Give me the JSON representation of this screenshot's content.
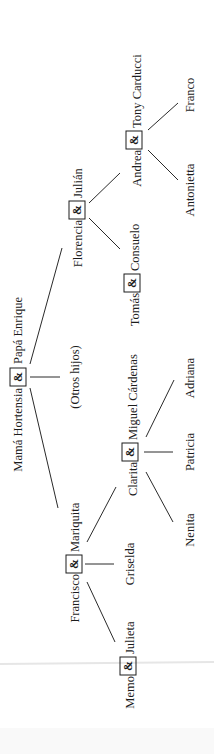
{
  "diagram": {
    "type": "family-tree",
    "orientation": "rotated-90-ccw",
    "colors": {
      "ink": "#1c1c1c",
      "background": "#ffffff",
      "fold_line": "#e6e6e6"
    },
    "couple_symbol": "&",
    "generation_1": {
      "couple": {
        "left": "Mamá Hortensia",
        "right": "Papá Enrique"
      }
    },
    "generation_2": {
      "francisco_couple": {
        "left": "Francisco",
        "right": "Mariquita"
      },
      "others": "(Otros hijos)",
      "florencia_couple": {
        "left": "Florencia",
        "right": "Julián"
      }
    },
    "generation_3": {
      "memo_couple": {
        "left": "Memo",
        "right": "Julieta"
      },
      "griselda": "Griselda",
      "clarita_couple": {
        "left": "Clarita",
        "right": "Miguel Cárdenas"
      },
      "tomas_couple": {
        "left": "Tomás",
        "right": "Consuelo"
      },
      "andrea_couple": {
        "left": "Andrea",
        "right": "Tony Carducci"
      }
    },
    "generation_4": {
      "nenita": "Nenita",
      "patricia": "Patricia",
      "adriana": "Adriana",
      "antonietta": "Antonietta",
      "franco": "Franco"
    }
  }
}
